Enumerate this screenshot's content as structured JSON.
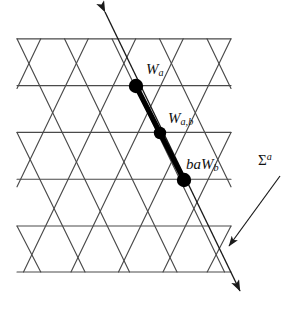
{
  "figure": {
    "background_color": "#ffffff",
    "lattice_line_color": "#4a4a4a",
    "path_color": "#000000",
    "vertex_color": "#000000",
    "wall_line_color": "#333333"
  },
  "labels": {
    "vertex_top": {
      "base": "W",
      "sub": "a",
      "full": "W_a"
    },
    "vertex_middle": {
      "base": "W",
      "sub": "a,b",
      "full": "W_{a,b}"
    },
    "vertex_bottom": {
      "prefix": "ba",
      "base": "W",
      "sub": "b",
      "full": "baW_b"
    },
    "wall": {
      "base": "Σ",
      "sup": "a",
      "full": "Σ^a"
    }
  },
  "geometry": {
    "lattice": {
      "left": 17,
      "right": 231,
      "rows_y": [
        39,
        86,
        133,
        180,
        227,
        272
      ],
      "column_spacing": 47.5,
      "row_spacing": 46.6,
      "columns_even": [
        17,
        64.5,
        112,
        159.5,
        207
      ],
      "columns_odd": [
        40.75,
        88.25,
        135.75,
        183.25,
        230.75
      ]
    },
    "marked_vertices": [
      {
        "name": "W_a",
        "x": 136,
        "y": 86,
        "radius": 7
      },
      {
        "name": "W_{a,b}",
        "x": 160,
        "y": 133,
        "radius": 6
      },
      {
        "name": "baW_b",
        "x": 184,
        "y": 180,
        "radius": 7
      }
    ],
    "wall_arrow": {
      "start_x": 105,
      "start_y": 12,
      "end_x": 240,
      "end_y": 291,
      "arrowheads": [
        "start",
        "end"
      ]
    },
    "sigma_pointer": {
      "start_x": 280,
      "start_y": 176,
      "end_x": 229,
      "end_y": 246,
      "arrowhead": "end"
    }
  }
}
